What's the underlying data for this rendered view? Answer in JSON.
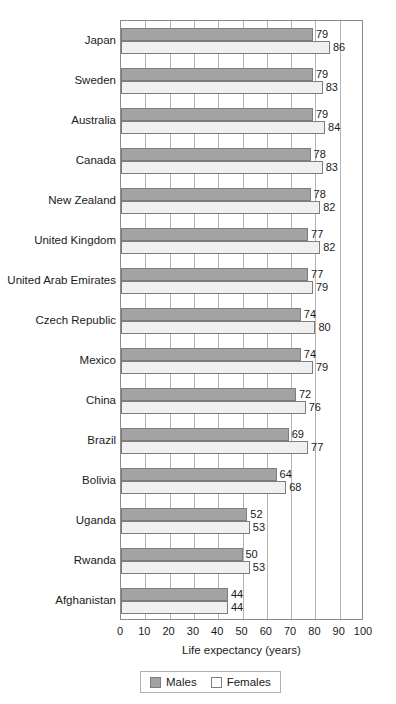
{
  "chart_data": {
    "type": "bar",
    "orientation": "horizontal",
    "title": "",
    "xlabel": "Life expectancy (years)",
    "ylabel": "",
    "xlim": [
      0,
      100
    ],
    "xticks": [
      0,
      10,
      20,
      30,
      40,
      50,
      60,
      70,
      80,
      90,
      100
    ],
    "grid": true,
    "grid_axis": "x",
    "legend_position": "bottom",
    "categories": [
      "Japan",
      "Sweden",
      "Australia",
      "Canada",
      "New Zealand",
      "United Kingdom",
      "United Arab Emirates",
      "Czech Republic",
      "Mexico",
      "China",
      "Brazil",
      "Bolivia",
      "Uganda",
      "Rwanda",
      "Afghanistan"
    ],
    "series": [
      {
        "name": "Males",
        "color": "#a3a3a3",
        "values": [
          79,
          79,
          79,
          78,
          78,
          77,
          77,
          74,
          74,
          72,
          69,
          64,
          52,
          50,
          44
        ]
      },
      {
        "name": "Females",
        "color": "#f0f0f0",
        "values": [
          86,
          83,
          84,
          83,
          82,
          82,
          79,
          80,
          79,
          76,
          77,
          68,
          53,
          53,
          44
        ]
      }
    ]
  },
  "legend": {
    "items": [
      {
        "label": "Males",
        "swatch": "male-swatch"
      },
      {
        "label": "Females",
        "swatch": "female-swatch"
      }
    ]
  },
  "axis": {
    "x_title": "Life expectancy (years)"
  }
}
